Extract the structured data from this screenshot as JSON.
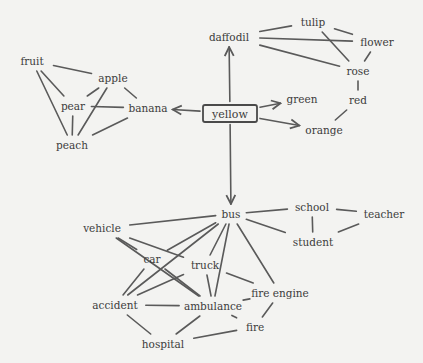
{
  "center": {
    "id": "yellow",
    "label": "yellow",
    "x": 230,
    "y": 113
  },
  "nodes": [
    {
      "id": "daffodil",
      "label": "daffodil",
      "x": 229,
      "y": 37
    },
    {
      "id": "tulip",
      "label": "tulip",
      "x": 313,
      "y": 22
    },
    {
      "id": "flower",
      "label": "flower",
      "x": 377,
      "y": 42
    },
    {
      "id": "rose",
      "label": "rose",
      "x": 358,
      "y": 71
    },
    {
      "id": "red",
      "label": "red",
      "x": 358,
      "y": 100
    },
    {
      "id": "green",
      "label": "green",
      "x": 302,
      "y": 99
    },
    {
      "id": "orange",
      "label": "orange",
      "x": 324,
      "y": 130
    },
    {
      "id": "fruit",
      "label": "fruit",
      "x": 32,
      "y": 61
    },
    {
      "id": "apple",
      "label": "apple",
      "x": 113,
      "y": 78
    },
    {
      "id": "pear",
      "label": "pear",
      "x": 73,
      "y": 106
    },
    {
      "id": "banana",
      "label": "banana",
      "x": 148,
      "y": 108
    },
    {
      "id": "peach",
      "label": "peach",
      "x": 72,
      "y": 145
    },
    {
      "id": "bus",
      "label": "bus",
      "x": 231,
      "y": 214
    },
    {
      "id": "school",
      "label": "school",
      "x": 312,
      "y": 207
    },
    {
      "id": "teacher",
      "label": "teacher",
      "x": 384,
      "y": 214
    },
    {
      "id": "student",
      "label": "student",
      "x": 313,
      "y": 242
    },
    {
      "id": "vehicle",
      "label": "vehicle",
      "x": 102,
      "y": 228
    },
    {
      "id": "car",
      "label": "car",
      "x": 152,
      "y": 259
    },
    {
      "id": "truck",
      "label": "truck",
      "x": 205,
      "y": 265
    },
    {
      "id": "fire_engine",
      "label": "fire engine",
      "x": 280,
      "y": 293
    },
    {
      "id": "accident",
      "label": "accident",
      "x": 115,
      "y": 305
    },
    {
      "id": "ambulance",
      "label": "ambulance",
      "x": 213,
      "y": 306
    },
    {
      "id": "fire",
      "label": "fire",
      "x": 255,
      "y": 327
    },
    {
      "id": "hospital",
      "label": "hospital",
      "x": 163,
      "y": 344
    }
  ],
  "arrows": [
    {
      "from": "yellow",
      "to": "daffodil"
    },
    {
      "from": "yellow",
      "to": "banana"
    },
    {
      "from": "yellow",
      "to": "green"
    },
    {
      "from": "yellow",
      "to": "orange"
    },
    {
      "from": "yellow",
      "to": "bus"
    }
  ],
  "edges": [
    [
      "daffodil",
      "tulip"
    ],
    [
      "daffodil",
      "flower"
    ],
    [
      "daffodil",
      "rose"
    ],
    [
      "tulip",
      "flower"
    ],
    [
      "tulip",
      "rose"
    ],
    [
      "flower",
      "rose"
    ],
    [
      "rose",
      "red"
    ],
    [
      "red",
      "orange"
    ],
    [
      "fruit",
      "apple"
    ],
    [
      "fruit",
      "pear"
    ],
    [
      "fruit",
      "peach"
    ],
    [
      "apple",
      "pear"
    ],
    [
      "apple",
      "banana"
    ],
    [
      "apple",
      "peach"
    ],
    [
      "pear",
      "banana"
    ],
    [
      "pear",
      "peach"
    ],
    [
      "banana",
      "peach"
    ],
    [
      "bus",
      "school"
    ],
    [
      "bus",
      "student"
    ],
    [
      "school",
      "student"
    ],
    [
      "school",
      "teacher"
    ],
    [
      "student",
      "teacher"
    ],
    [
      "bus",
      "vehicle"
    ],
    [
      "bus",
      "car"
    ],
    [
      "bus",
      "truck"
    ],
    [
      "bus",
      "accident"
    ],
    [
      "bus",
      "ambulance"
    ],
    [
      "bus",
      "fire_engine"
    ],
    [
      "vehicle",
      "car"
    ],
    [
      "vehicle",
      "truck"
    ],
    [
      "vehicle",
      "ambulance"
    ],
    [
      "car",
      "accident"
    ],
    [
      "car",
      "ambulance"
    ],
    [
      "truck",
      "accident"
    ],
    [
      "truck",
      "ambulance"
    ],
    [
      "truck",
      "fire_engine"
    ],
    [
      "accident",
      "ambulance"
    ],
    [
      "accident",
      "hospital"
    ],
    [
      "ambulance",
      "hospital"
    ],
    [
      "ambulance",
      "fire_engine"
    ],
    [
      "ambulance",
      "fire"
    ],
    [
      "fire_engine",
      "fire"
    ],
    [
      "fire",
      "hospital"
    ]
  ]
}
